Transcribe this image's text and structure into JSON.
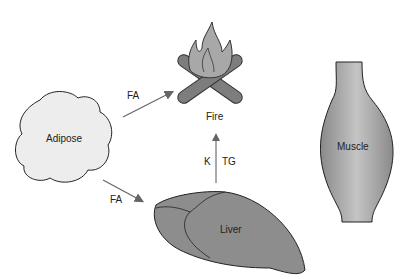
{
  "diagram": {
    "nodes": {
      "adipose": {
        "label": "Adipose",
        "fill": "#ececec"
      },
      "fire": {
        "label": "Fire",
        "fill": "#a6a6a6"
      },
      "liver": {
        "label": "Liver",
        "fill": "#8c8c8c"
      },
      "muscle": {
        "label": "Muscle",
        "fill": "#a0a0a0"
      }
    },
    "edges": [
      {
        "from": "adipose",
        "to": "fire",
        "label": "FA"
      },
      {
        "from": "adipose",
        "to": "liver",
        "label": "FA"
      },
      {
        "from": "liver",
        "to": "fire",
        "label_left": "K",
        "label_right": "TG"
      }
    ]
  }
}
